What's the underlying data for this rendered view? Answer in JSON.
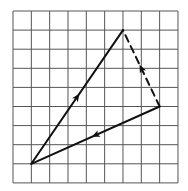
{
  "diagram": {
    "type": "vector-triangle-on-grid",
    "grid": {
      "columns": 9,
      "rows": 9,
      "origin_px": [
        13,
        11
      ],
      "cell_w": 18.33,
      "cell_h": 19.1,
      "line_color": "#555555"
    },
    "points": {
      "A": [
        1,
        8
      ],
      "B": [
        6,
        1
      ],
      "C": [
        8,
        5
      ]
    },
    "vectors": [
      {
        "name": "vector-a-to-b",
        "from": "A",
        "to": "B",
        "style": "solid",
        "arrow_at": 0.5
      },
      {
        "name": "vector-c-to-a",
        "from": "C",
        "to": "A",
        "style": "solid",
        "arrow_at": 0.5
      },
      {
        "name": "vector-c-to-b",
        "from": "C",
        "to": "B",
        "style": "dashed",
        "arrow_at": 0.5
      }
    ],
    "stroke_color": "#111111"
  }
}
